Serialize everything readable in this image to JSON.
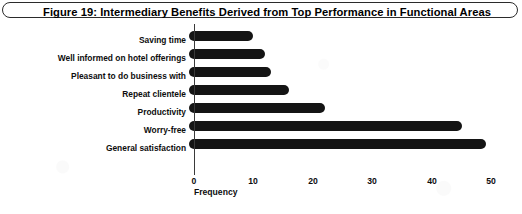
{
  "figure": {
    "title": "Figure 19: Intermediary Benefits Derived from Top Performance in Functional Areas"
  },
  "chart_data": {
    "type": "bar",
    "orientation": "horizontal",
    "title": "Figure 19: Intermediary Benefits Derived from Top Performance in Functional Areas",
    "xlabel": "Frequency",
    "ylabel": "",
    "categories": [
      "Saving time",
      "Well informed on hotel offerings",
      "Pleasant to do business with",
      "Repeat clientele",
      "Productivity",
      "Worry-free",
      "General satisfaction"
    ],
    "values": [
      10,
      12,
      13,
      16,
      22,
      45,
      49
    ],
    "xlim": [
      0,
      50
    ],
    "xticks": [
      0,
      10,
      20,
      30,
      40,
      50
    ],
    "xtick_labels": [
      "0",
      "10",
      "20",
      "30",
      "40",
      "50"
    ],
    "grid": false,
    "legend": false,
    "bar_color": "#141414"
  },
  "colors": {
    "bar": "#141414",
    "axis": "#3a3a3a",
    "text": "#0d0d0d",
    "banner_border": "#2b2b2b",
    "background": "#ffffff"
  }
}
